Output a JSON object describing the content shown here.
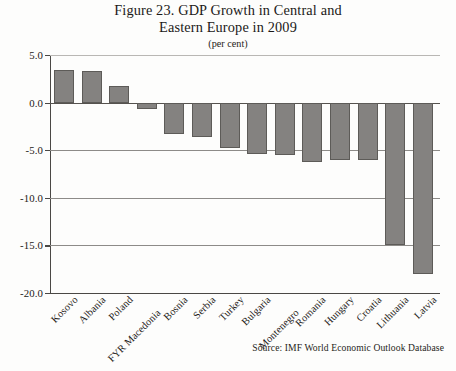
{
  "figure": {
    "title_line_1": "Figure 23. GDP Growth in Central and",
    "title_line_2": "Eastern Europe in 2009",
    "subtitle": "(per cent)",
    "source": "Source: IMF World Economic Outlook Database",
    "bar_fill_color": "#848280",
    "bar_edge_color": "#5d5b58",
    "gridline_color": "#8d8b88",
    "axis_color": "#4a4845",
    "background_color": "#fdfdfc"
  },
  "chart_data": {
    "type": "bar",
    "title": "Figure 23. GDP Growth in Central and Eastern Europe in 2009",
    "subtitle": "(per cent)",
    "xlabel": "",
    "ylabel": "",
    "unit": "per cent",
    "ylim": [
      -20.0,
      5.0
    ],
    "ytick_labels": [
      "5.0",
      "0.0",
      "-5.0",
      "-10.0",
      "-15.0",
      "-20.0"
    ],
    "ytick_values": [
      5.0,
      0.0,
      -5.0,
      -10.0,
      -15.0,
      -20.0
    ],
    "grid": true,
    "grid_axis": "y",
    "legend": false,
    "legend_position": "none",
    "orientation": "vertical",
    "sorted": "descending",
    "categories": [
      "Kosovo",
      "Albania",
      "Poland",
      "FYR Macedonia",
      "Bosnia",
      "Serbia",
      "Turkey",
      "Bulgaria",
      "Montenegro",
      "Romania",
      "Hungary",
      "Croatia",
      "Lithuania",
      "Latvia"
    ],
    "values": [
      3.4,
      3.3,
      1.7,
      -0.7,
      -3.3,
      -3.6,
      -4.8,
      -5.4,
      -5.5,
      -6.2,
      -6.0,
      -6.0,
      -15.0,
      -18.0
    ],
    "series": [
      {
        "name": "GDP growth 2009",
        "values": [
          3.4,
          3.3,
          1.7,
          -0.7,
          -3.3,
          -3.6,
          -4.8,
          -5.4,
          -5.5,
          -6.2,
          -6.0,
          -6.0,
          -15.0,
          -18.0
        ]
      }
    ],
    "source": "Source: IMF World Economic Outlook Database"
  }
}
